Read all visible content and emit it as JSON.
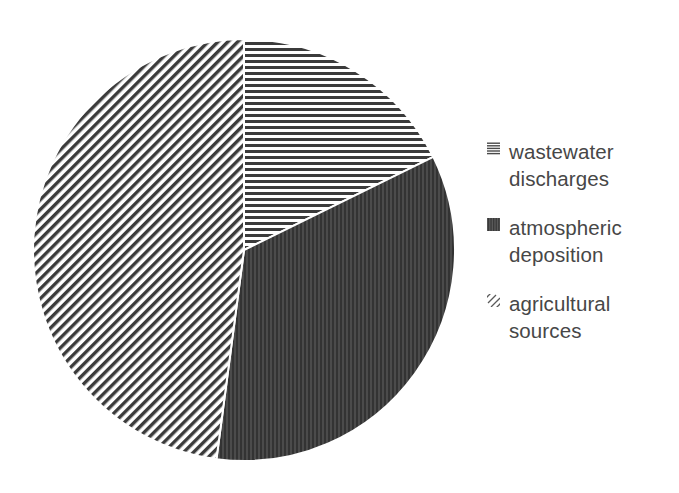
{
  "chart_data": {
    "type": "pie",
    "title": "",
    "subtitle": "",
    "xlabel": "",
    "ylabel": "",
    "grid": false,
    "legend_position": "right",
    "start_angle_deg": 0,
    "direction": "clockwise",
    "center": {
      "x": 244,
      "y": 250
    },
    "radius": 211,
    "categories": [
      "wastewater discharges",
      "atmospheric deposition",
      "agricultural sources"
    ],
    "values": [
      17.7,
      34.4,
      47.9
    ],
    "slices": [
      {
        "label": "wastewater discharges",
        "value": 17.7,
        "start_angle_deg": 0.0,
        "end_angle_deg": 63.8,
        "pattern": "horizontal-lines",
        "pattern_name": "horizontal-hatch-icon",
        "color": "#3b3b3b",
        "fill_background": "#ffffff"
      },
      {
        "label": "atmospheric deposition",
        "value": 34.4,
        "start_angle_deg": 63.8,
        "end_angle_deg": 187.5,
        "pattern": "dense-vertical-dark",
        "pattern_name": "solid-dark-icon",
        "color": "#3a3a3a",
        "fill_background": "#4a4a4a"
      },
      {
        "label": "agricultural sources",
        "value": 47.9,
        "start_angle_deg": 187.5,
        "end_angle_deg": 360.0,
        "pattern": "diagonal-lines",
        "pattern_name": "diagonal-hatch-icon",
        "color": "#3b3b3b",
        "fill_background": "#ffffff"
      }
    ]
  },
  "legend": {
    "entries": [
      {
        "label": "wastewater discharges",
        "swatch": "horizontal-hatch-icon"
      },
      {
        "label": "atmospheric deposition",
        "swatch": "solid-dark-icon"
      },
      {
        "label": "agricultural sources",
        "swatch": "diagonal-hatch-icon"
      }
    ]
  },
  "colors": {
    "text": "#474747",
    "stroke": "#ffffff",
    "background": "#ffffff",
    "hatch": "#3b3b3b",
    "dark_fill": "#4a4a4a"
  }
}
